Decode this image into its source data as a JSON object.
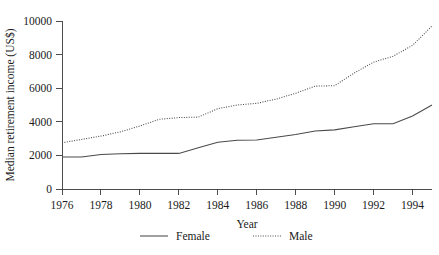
{
  "chart_data": {
    "type": "line",
    "title": "",
    "xlabel": "Year",
    "ylabel": "Median retirement income (US$)",
    "xlim": [
      1976,
      1995
    ],
    "ylim": [
      0,
      10000
    ],
    "grid": false,
    "legend_position": "bottom-center",
    "x": [
      1976,
      1977,
      1978,
      1979,
      1980,
      1981,
      1982,
      1983,
      1984,
      1985,
      1986,
      1987,
      1988,
      1989,
      1990,
      1991,
      1992,
      1993,
      1994,
      1995
    ],
    "xticks": [
      1976,
      1978,
      1980,
      1982,
      1984,
      1986,
      1988,
      1990,
      1992,
      1994
    ],
    "xtick_labels": [
      "1976",
      "1978",
      "1980",
      "1982",
      "1984",
      "1986",
      "1988",
      "1990",
      "1992",
      "1994"
    ],
    "yticks": [
      0,
      2000,
      4000,
      6000,
      8000,
      10000
    ],
    "ytick_labels": [
      "0",
      "2000",
      "4000",
      "6000",
      "8000",
      "10000"
    ],
    "series": [
      {
        "name": "Female",
        "style": "solid",
        "color": "#4a4a4a",
        "values": [
          1900,
          1900,
          2050,
          2100,
          2120,
          2120,
          2120,
          2450,
          2780,
          2900,
          2920,
          3080,
          3250,
          3450,
          3520,
          3700,
          3880,
          3880,
          4350,
          5000
        ]
      },
      {
        "name": "Male",
        "style": "dotted",
        "color": "#4a4a4a",
        "values": [
          2750,
          2950,
          3150,
          3400,
          3750,
          4150,
          4250,
          4280,
          4780,
          5000,
          5100,
          5350,
          5700,
          6120,
          6150,
          6900,
          7550,
          7900,
          8550,
          9700
        ]
      }
    ]
  },
  "legend": {
    "items": [
      {
        "label": "Female",
        "style": "solid"
      },
      {
        "label": "Male",
        "style": "dotted"
      }
    ]
  }
}
